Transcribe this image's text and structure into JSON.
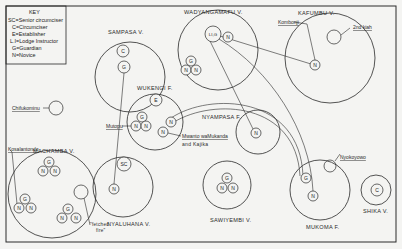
{
  "key": {
    "title": "KEY",
    "entries": [
      "SC=Senior circumciser",
      "C=Circumciser",
      "E=Establisher",
      "L.I=Lodge Instructor",
      "G=Guardian",
      "N=Novice"
    ]
  },
  "villages": [
    {
      "id": "sampasa",
      "label": "SAMPASA V.",
      "cx": 130,
      "cy": 77,
      "r": 35,
      "lx": 108,
      "ly": 34
    },
    {
      "id": "wadyangamafu",
      "label": "WADYANGAMAFU V.",
      "cx": 218,
      "cy": 50,
      "r": 40,
      "lx": 184,
      "ly": 14
    },
    {
      "id": "kafumbu",
      "label": "KAFUMBU V.",
      "cx": 330,
      "cy": 58,
      "r": 45,
      "lx": 298,
      "ly": 15
    },
    {
      "id": "wukengi",
      "label": "WUKENGI F.",
      "cx": 155,
      "cy": 122,
      "r": 28,
      "lx": 137,
      "ly": 90
    },
    {
      "id": "nyampasa",
      "label": "NYAMPASA F.",
      "cx": 258,
      "cy": 132,
      "r": 22,
      "lx": 202,
      "ly": 119
    },
    {
      "id": "machamba",
      "label": "MACHAMBA V.",
      "cx": 52,
      "cy": 194,
      "r": 44,
      "lx": 33,
      "ly": 153
    },
    {
      "id": "nyaluhana",
      "label": "NYALUHANA V.",
      "cx": 123,
      "cy": 187,
      "r": 30,
      "lx": 107,
      "ly": 226
    },
    {
      "id": "sawiyembi",
      "label": "SAWIYEMBI V.",
      "cx": 227,
      "cy": 185,
      "r": 24,
      "lx": 210,
      "ly": 222
    },
    {
      "id": "mukoma",
      "label": "MUKOMA F.",
      "cx": 320,
      "cy": 190,
      "r": 30,
      "lx": 306,
      "ly": 229
    },
    {
      "id": "shika",
      "label": "SHIKA V.",
      "cx": 376,
      "cy": 190,
      "r": 15,
      "lx": 363,
      "ly": 213
    }
  ],
  "nodes": [
    {
      "t": "C",
      "x": 123,
      "y": 51,
      "r": 6
    },
    {
      "t": "G",
      "x": 124,
      "y": 67,
      "r": 6
    },
    {
      "t": "LI,G",
      "x": 213,
      "y": 34,
      "r": 8
    },
    {
      "t": "N",
      "x": 228,
      "y": 37,
      "r": 5
    },
    {
      "t": "G",
      "x": 191,
      "y": 61,
      "r": 5
    },
    {
      "t": "N",
      "x": 186,
      "y": 70,
      "r": 5
    },
    {
      "t": "N",
      "x": 196,
      "y": 70,
      "r": 5
    },
    {
      "t": "N",
      "x": 315,
      "y": 65,
      "r": 5
    },
    {
      "t": "E",
      "x": 156,
      "y": 100,
      "r": 6
    },
    {
      "t": "G",
      "x": 142,
      "y": 117,
      "r": 5
    },
    {
      "t": "N",
      "x": 136,
      "y": 126,
      "r": 5
    },
    {
      "t": "N",
      "x": 146,
      "y": 126,
      "r": 5
    },
    {
      "t": "N",
      "x": 171,
      "y": 122,
      "r": 5
    },
    {
      "t": "N",
      "x": 163,
      "y": 132,
      "r": 5
    },
    {
      "t": "N",
      "x": 256,
      "y": 133,
      "r": 5
    },
    {
      "t": "SC",
      "x": 124,
      "y": 164,
      "r": 7
    },
    {
      "t": "N",
      "x": 114,
      "y": 189,
      "r": 5
    },
    {
      "t": "G",
      "x": 49,
      "y": 162,
      "r": 5
    },
    {
      "t": "N",
      "x": 43,
      "y": 171,
      "r": 5
    },
    {
      "t": "N",
      "x": 55,
      "y": 171,
      "r": 5
    },
    {
      "t": "G",
      "x": 25,
      "y": 199,
      "r": 5
    },
    {
      "t": "N",
      "x": 19,
      "y": 208,
      "r": 5
    },
    {
      "t": "N",
      "x": 31,
      "y": 208,
      "r": 5
    },
    {
      "t": "G",
      "x": 68,
      "y": 209,
      "r": 5
    },
    {
      "t": "N",
      "x": 62,
      "y": 218,
      "r": 5
    },
    {
      "t": "N",
      "x": 76,
      "y": 218,
      "r": 5
    },
    {
      "t": "G",
      "x": 227,
      "y": 178,
      "r": 5
    },
    {
      "t": "N",
      "x": 222,
      "y": 188,
      "r": 5
    },
    {
      "t": "N",
      "x": 233,
      "y": 188,
      "r": 5
    },
    {
      "t": "G",
      "x": 306,
      "y": 178,
      "r": 5
    },
    {
      "t": "N",
      "x": 313,
      "y": 196,
      "r": 5
    },
    {
      "t": "C",
      "x": 377,
      "y": 190,
      "r": 6
    }
  ],
  "empty_circles": [
    {
      "x": 334,
      "y": 37,
      "r": 7
    },
    {
      "x": 56,
      "y": 108,
      "r": 7
    },
    {
      "x": 81,
      "y": 192,
      "r": 7
    },
    {
      "x": 330,
      "y": 166,
      "r": 6
    }
  ],
  "annotations": {
    "second_kiah": "2nd kiah",
    "chifukominu": "Chifukominu",
    "kombonji": "Kombonji",
    "mutopu": "Mutopu",
    "mwanto_line1": "Mwanto waMukanda",
    "mwanto_line2": "and Kajika",
    "kosalantondo": "Kosalantondo",
    "nyokoyowo": "Nyokoyowo",
    "fetched_fire_line1": "\"fetched",
    "fetched_fire_line2": "fire\""
  },
  "colors": {
    "ink": "#2a2a2a",
    "paper": "#f4f4f2"
  }
}
